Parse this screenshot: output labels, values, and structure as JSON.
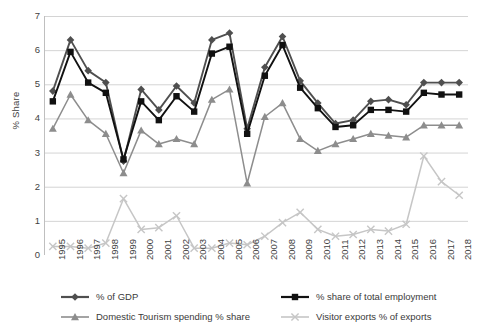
{
  "chart_data": {
    "type": "line",
    "title": "",
    "xlabel": "",
    "ylabel": "% Share",
    "ylim": [
      0,
      7
    ],
    "ytick_step": 1,
    "grid": true,
    "legend_position": "bottom",
    "x": [
      "1995",
      "1996",
      "1997",
      "1998",
      "1999",
      "2000",
      "2001",
      "2002",
      "2003",
      "2004",
      "2005",
      "2006",
      "2007",
      "2008",
      "2009",
      "2010",
      "2011",
      "2012",
      "2013",
      "2014",
      "2015",
      "2016",
      "2017",
      "2018"
    ],
    "series": [
      {
        "name": "% of GDP",
        "marker": "diamond",
        "color": "#4f4f4f",
        "values": [
          4.8,
          6.3,
          5.4,
          5.05,
          2.75,
          4.85,
          4.25,
          4.95,
          4.45,
          6.3,
          6.5,
          3.7,
          5.5,
          6.4,
          5.1,
          4.45,
          3.85,
          3.95,
          4.5,
          4.55,
          4.4,
          5.05,
          5.05,
          5.05
        ]
      },
      {
        "name": "% share of total employment",
        "marker": "square",
        "color": "#111111",
        "values": [
          4.5,
          5.95,
          5.05,
          4.75,
          2.8,
          4.5,
          3.95,
          4.65,
          4.2,
          5.9,
          6.1,
          3.55,
          5.25,
          6.15,
          4.9,
          4.3,
          3.75,
          3.8,
          4.25,
          4.25,
          4.2,
          4.75,
          4.7,
          4.7
        ]
      },
      {
        "name": "Domestic Tourism spending % share",
        "marker": "triangle",
        "color": "#8d8d8d",
        "values": [
          3.7,
          4.7,
          3.95,
          3.55,
          2.4,
          3.65,
          3.25,
          3.4,
          3.25,
          4.55,
          4.85,
          2.1,
          4.05,
          4.45,
          3.4,
          3.05,
          3.25,
          3.4,
          3.55,
          3.5,
          3.45,
          3.8,
          3.8,
          3.8
        ]
      },
      {
        "name": "Visitor exports % of exports",
        "marker": "x",
        "color": "#c6c6c6",
        "values": [
          0.25,
          0.25,
          0.2,
          0.35,
          1.65,
          0.75,
          0.8,
          1.15,
          0.2,
          0.2,
          0.35,
          0.3,
          0.55,
          0.95,
          1.25,
          0.75,
          0.55,
          0.6,
          0.75,
          0.7,
          0.9,
          2.9,
          2.15,
          1.75
        ]
      }
    ],
    "y_ticks": [
      "7",
      "6",
      "5",
      "4",
      "3",
      "2",
      "1",
      "0"
    ]
  },
  "legend": {
    "items": [
      {
        "label": "% of GDP"
      },
      {
        "label": "% share of total employment"
      },
      {
        "label": "Domestic Tourism spending % share"
      },
      {
        "label": "Visitor exports % of exports"
      }
    ]
  }
}
